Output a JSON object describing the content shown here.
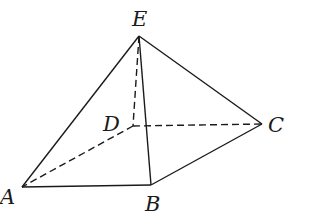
{
  "diagram": {
    "type": "pyramid",
    "vertices": {
      "A": {
        "label": "A",
        "x": 22,
        "y": 187
      },
      "B": {
        "label": "B",
        "x": 151,
        "y": 185
      },
      "C": {
        "label": "C",
        "x": 262,
        "y": 124
      },
      "D": {
        "label": "D",
        "x": 133,
        "y": 126
      },
      "E": {
        "label": "E",
        "x": 139,
        "y": 36
      }
    },
    "solid_edges": [
      "EA",
      "EB",
      "EC",
      "AB",
      "BC"
    ],
    "dashed_edges": [
      "ED",
      "DA",
      "DC"
    ],
    "colors": {
      "stroke": "#1a1a1a",
      "background": "#ffffff"
    }
  }
}
